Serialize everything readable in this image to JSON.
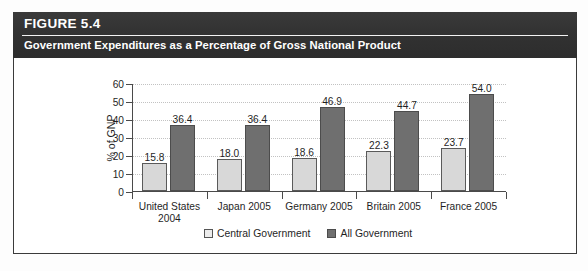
{
  "figure": {
    "number_label": "FIGURE 5.4",
    "caption": "Government Expenditures as a Percentage of Gross National Product"
  },
  "colors": {
    "header_band": "#353535",
    "frame_border": "#3b3b3b",
    "central_government_bar": "#d8d8d8",
    "all_government_bar": "#6f6f6f",
    "gridline": "#c2c2c2",
    "axis": "#4a4a4a"
  },
  "legend": {
    "items": [
      {
        "label": "Central Government",
        "swatch": "central"
      },
      {
        "label": "All Government",
        "swatch": "all"
      }
    ]
  },
  "source_note": "",
  "chart_data": {
    "type": "bar",
    "title": "Government Expenditures as a Percentage of Gross National Product",
    "xlabel": "",
    "ylabel": "% of GNP",
    "ylim": [
      0,
      60
    ],
    "yticks": [
      0,
      10,
      20,
      30,
      40,
      50,
      60
    ],
    "ytick_labels": [
      "0",
      "10",
      "20",
      "30",
      "40",
      "50",
      "60"
    ],
    "grid": true,
    "grid_axis": "y",
    "legend_position": "bottom-center",
    "categories": [
      "United States 2004",
      "Japan 2005",
      "Germany 2005",
      "Britain 2005",
      "France 2005"
    ],
    "category_lines": [
      [
        "United States",
        "2004"
      ],
      [
        "Japan 2005"
      ],
      [
        "Germany 2005"
      ],
      [
        "Britain 2005"
      ],
      [
        "France 2005"
      ]
    ],
    "series": [
      {
        "name": "Central Government",
        "color": "#d8d8d8",
        "values": [
          15.8,
          18.0,
          18.6,
          22.3,
          23.7
        ],
        "value_labels": [
          "15.8",
          "18.0",
          "18.6",
          "22.3",
          "23.7"
        ]
      },
      {
        "name": "All Government",
        "color": "#6f6f6f",
        "values": [
          36.4,
          36.4,
          46.9,
          44.7,
          54.0
        ],
        "value_labels": [
          "36.4",
          "36.4",
          "46.9",
          "44.7",
          "54.0"
        ]
      }
    ]
  }
}
